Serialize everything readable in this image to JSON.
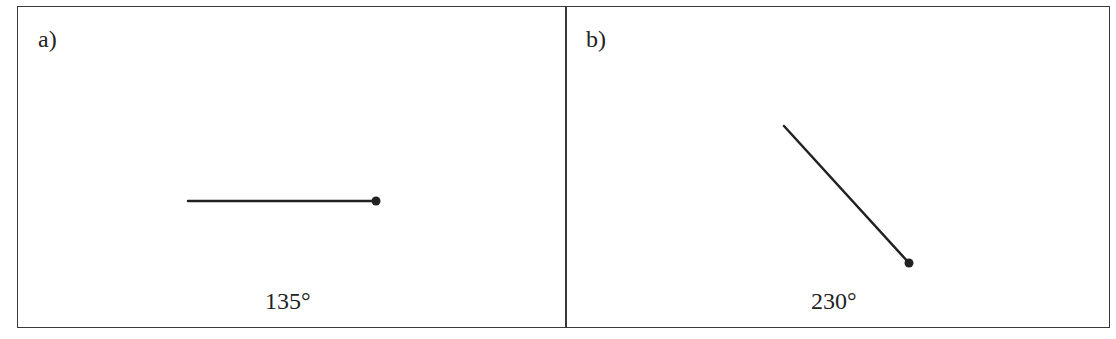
{
  "panels": [
    {
      "label": "a)",
      "angle_text": "135°",
      "line": {
        "x1": 188,
        "y1": 201,
        "x2": 376,
        "y2": 201
      },
      "dot": {
        "cx": 376,
        "cy": 201,
        "r": 4.5
      },
      "angle_pos": {
        "left": 265,
        "top": 288
      }
    },
    {
      "label": "b)",
      "angle_text": "230°",
      "line": {
        "x1": 784,
        "y1": 126,
        "x2": 909,
        "y2": 263
      },
      "dot": {
        "cx": 909,
        "cy": 263,
        "r": 4.5
      },
      "angle_pos": {
        "left": 811,
        "top": 288
      }
    }
  ],
  "colors": {
    "stroke": "#222222",
    "border": "#3a3a3a"
  }
}
